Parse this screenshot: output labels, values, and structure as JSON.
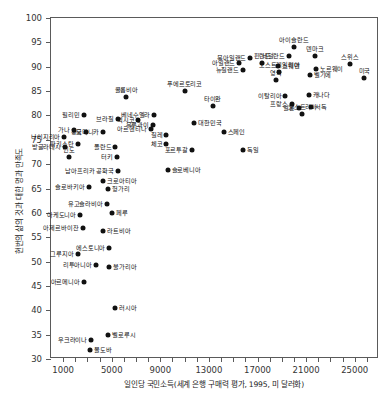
{
  "chart_data": {
    "type": "scatter",
    "title": "",
    "xlabel": "일인당 국민소득(세계 은행 구매력 평가, 1995, 미 달러화)",
    "ylabel": "현번의 삶의 것과 대한 명과 만족도",
    "xlim": [
      0,
      27000
    ],
    "ylim": [
      30,
      100
    ],
    "xticks": [
      0,
      1000,
      2000,
      3000,
      4000,
      5000,
      6000,
      7000,
      8000,
      9000,
      10000,
      11000,
      12000,
      13000,
      14000,
      15000,
      16000,
      17000,
      18000,
      19000,
      20000,
      21000,
      22000,
      23000,
      24000,
      25000,
      26000,
      27000
    ],
    "xtick_labels": [
      {
        "value": 1000,
        "label": "1000"
      },
      {
        "value": 5000,
        "label": "5000"
      },
      {
        "value": 9000,
        "label": "9000"
      },
      {
        "value": 13000,
        "label": "13000"
      },
      {
        "value": 17000,
        "label": "17000"
      },
      {
        "value": 21000,
        "label": "21000"
      },
      {
        "value": 25000,
        "label": "25000"
      }
    ],
    "ytick_labels": [
      {
        "value": 100,
        "label": "100"
      },
      {
        "value": 95,
        "label": "95"
      },
      {
        "value": 90,
        "label": "90"
      },
      {
        "value": 85,
        "label": "85"
      },
      {
        "value": 80,
        "label": "80"
      },
      {
        "value": 75,
        "label": "75"
      },
      {
        "value": 70,
        "label": "70"
      },
      {
        "value": 65,
        "label": "65"
      },
      {
        "value": 60,
        "label": "60"
      },
      {
        "value": 55,
        "label": "55"
      },
      {
        "value": 50,
        "label": "50"
      },
      {
        "value": 45,
        "label": "45"
      },
      {
        "value": 40,
        "label": "40"
      },
      {
        "value": 35,
        "label": "35"
      },
      {
        "value": 30,
        "label": "30"
      }
    ],
    "grid": false,
    "legend": false,
    "marker_color": "#111111",
    "axis_color": "#5a5a5a",
    "points": [
      {
        "label": "나이지리아",
        "x": 1100,
        "y": 75.5,
        "lpos": "r"
      },
      {
        "label": "방글라데시",
        "x": 1150,
        "y": 73.5,
        "lpos": "r"
      },
      {
        "label": "인도",
        "x": 1450,
        "y": 71.5,
        "lpos": "c"
      },
      {
        "label": "가나",
        "x": 1900,
        "y": 77.0,
        "lpos": "r"
      },
      {
        "label": "필리민",
        "x": 2700,
        "y": 80.0,
        "lpos": "r"
      },
      {
        "label": "중국",
        "x": 2900,
        "y": 76.5,
        "lpos": "r"
      },
      {
        "label": "파키스탄",
        "x": 2200,
        "y": 74.2,
        "lpos": "r"
      },
      {
        "label": "브라질",
        "x": 5500,
        "y": 79.3,
        "lpos": "r"
      },
      {
        "label": "도미니카",
        "x": 4300,
        "y": 76.7,
        "lpos": "r"
      },
      {
        "label": "아르헨티나",
        "x": 8200,
        "y": 77.2,
        "lpos": "r"
      },
      {
        "label": "폴란드",
        "x": 5300,
        "y": 73.5,
        "lpos": "r"
      },
      {
        "label": "터키",
        "x": 5400,
        "y": 71.5,
        "lpos": "r"
      },
      {
        "label": "멕시코",
        "x": 7200,
        "y": 79.0,
        "lpos": "r"
      },
      {
        "label": "콜롬비아",
        "x": 6200,
        "y": 83.7,
        "lpos": "c"
      },
      {
        "label": "베네수엘라",
        "x": 8500,
        "y": 80.0,
        "lpos": "r"
      },
      {
        "label": "우루과이",
        "x": 8400,
        "y": 78.0,
        "lpos": "r"
      },
      {
        "label": "칠레",
        "x": 9500,
        "y": 76.0,
        "lpos": "r"
      },
      {
        "label": "체코",
        "x": 9500,
        "y": 74.2,
        "lpos": "r"
      },
      {
        "label": "타이완",
        "x": 13300,
        "y": 82.0,
        "lpos": "c"
      },
      {
        "label": "푸에르토리코",
        "x": 11000,
        "y": 85.0,
        "lpos": "c"
      },
      {
        "label": "대한민국",
        "x": 11800,
        "y": 78.5,
        "lpos": "l"
      },
      {
        "label": "포르투갈",
        "x": 11600,
        "y": 73.0,
        "lpos": "r"
      },
      {
        "label": "스페인",
        "x": 14200,
        "y": 76.5,
        "lpos": "l"
      },
      {
        "label": "독일",
        "x": 15800,
        "y": 73.0,
        "lpos": "l"
      },
      {
        "label": "아일랜드",
        "x": 15500,
        "y": 90.8,
        "lpos": "r"
      },
      {
        "label": "북아일랜드",
        "x": 16400,
        "y": 91.8,
        "lpos": "r"
      },
      {
        "label": "뉴질랜드",
        "x": 15800,
        "y": 89.4,
        "lpos": "r"
      },
      {
        "label": "핀란드",
        "x": 17400,
        "y": 90.7,
        "lpos": "c"
      },
      {
        "label": "스웨덴",
        "x": 18700,
        "y": 90.2,
        "lpos": "l"
      },
      {
        "label": "오스트레일리아",
        "x": 18800,
        "y": 89.0,
        "lpos": "c"
      },
      {
        "label": "네덜란드",
        "x": 19600,
        "y": 92.3,
        "lpos": "r"
      },
      {
        "label": "아이슬란드",
        "x": 20000,
        "y": 94.0,
        "lpos": "c"
      },
      {
        "label": "덴마크",
        "x": 21700,
        "y": 92.2,
        "lpos": "c"
      },
      {
        "label": "노르웨이",
        "x": 21800,
        "y": 89.6,
        "lpos": "l"
      },
      {
        "label": "벨기에",
        "x": 21300,
        "y": 88.3,
        "lpos": "l"
      },
      {
        "label": "영국",
        "x": 18500,
        "y": 87.3,
        "lpos": "c"
      },
      {
        "label": "이탈리아",
        "x": 19300,
        "y": 84.0,
        "lpos": "r"
      },
      {
        "label": "프랑스",
        "x": 19800,
        "y": 82.3,
        "lpos": "r"
      },
      {
        "label": "일본",
        "x": 20400,
        "y": 81.5,
        "lpos": "r"
      },
      {
        "label": "캐나다",
        "x": 21200,
        "y": 84.2,
        "lpos": "l"
      },
      {
        "label": "서독",
        "x": 21400,
        "y": 81.7,
        "lpos": "l"
      },
      {
        "label": "오스트리아",
        "x": 20700,
        "y": 80.2,
        "lpos": "c"
      },
      {
        "label": "스위스",
        "x": 24600,
        "y": 90.5,
        "lpos": "c"
      },
      {
        "label": "미국",
        "x": 25800,
        "y": 87.6,
        "lpos": "c"
      },
      {
        "label": "남아프리카 공화국",
        "x": 5500,
        "y": 68.6,
        "lpos": "r"
      },
      {
        "label": "슬로베니아",
        "x": 9600,
        "y": 68.9,
        "lpos": "l"
      },
      {
        "label": "슬로바키아",
        "x": 3100,
        "y": 65.3,
        "lpos": "r"
      },
      {
        "label": "크로아티아",
        "x": 4300,
        "y": 66.5,
        "lpos": "l"
      },
      {
        "label": "헝가리",
        "x": 4700,
        "y": 64.8,
        "lpos": "l"
      },
      {
        "label": "유고슬라비아",
        "x": 4600,
        "y": 61.8,
        "lpos": "r"
      },
      {
        "label": "페루",
        "x": 5000,
        "y": 60.0,
        "lpos": "l"
      },
      {
        "label": "아케도니아",
        "x": 2400,
        "y": 59.6,
        "lpos": "r"
      },
      {
        "label": "아제르바이잔",
        "x": 2600,
        "y": 56.8,
        "lpos": "r"
      },
      {
        "label": "라트비아",
        "x": 4300,
        "y": 56.3,
        "lpos": "l"
      },
      {
        "label": "에스토니아",
        "x": 4800,
        "y": 52.8,
        "lpos": "r"
      },
      {
        "label": "그루지아",
        "x": 2200,
        "y": 51.5,
        "lpos": "r"
      },
      {
        "label": "리투아니아",
        "x": 3700,
        "y": 49.3,
        "lpos": "r"
      },
      {
        "label": "불가리아",
        "x": 4800,
        "y": 48.8,
        "lpos": "l"
      },
      {
        "label": "아르메니아",
        "x": 2700,
        "y": 45.8,
        "lpos": "r"
      },
      {
        "label": "러시아",
        "x": 5300,
        "y": 40.5,
        "lpos": "l"
      },
      {
        "label": "벨로루시",
        "x": 4700,
        "y": 35.0,
        "lpos": "l"
      },
      {
        "label": "우크라이나",
        "x": 3300,
        "y": 34.0,
        "lpos": "r"
      },
      {
        "label": "몰도바",
        "x": 3200,
        "y": 31.8,
        "lpos": "l"
      }
    ]
  }
}
